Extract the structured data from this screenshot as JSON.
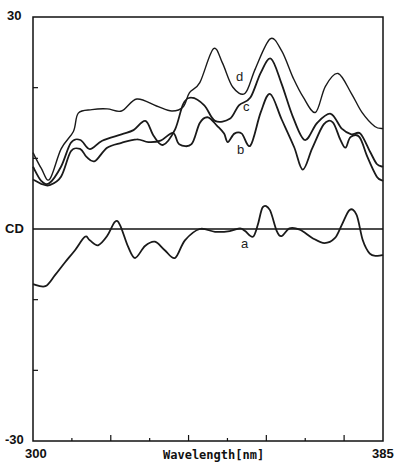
{
  "chart_data": {
    "type": "line",
    "title": "",
    "xlabel": "Wavelength[nm]",
    "ylabel": "CD",
    "xlim": [
      300,
      385
    ],
    "ylim": [
      -30,
      30
    ],
    "x_tick_labels": [
      "300",
      "385"
    ],
    "y_tick_labels": [
      "30",
      "-30"
    ],
    "y_ticks": [
      30,
      20,
      10,
      0,
      -10,
      -20,
      -30
    ],
    "x_ticks_minor_count": 8,
    "grid": false,
    "legend": "curve labels placed inline (a, b, c, d)",
    "zero_line": true,
    "series": [
      {
        "name": "a",
        "label_pos": [
          351,
          -2.3
        ],
        "points": [
          [
            300,
            -7.8
          ],
          [
            303,
            -8.1
          ],
          [
            305.4,
            -6.5
          ],
          [
            307.8,
            -4.7
          ],
          [
            310.2,
            -3.0
          ],
          [
            312.6,
            -1.1
          ],
          [
            313.8,
            -1.6
          ],
          [
            315.8,
            -2.3
          ],
          [
            318,
            -1.0
          ],
          [
            319.9,
            1.0
          ],
          [
            321.1,
            0.6
          ],
          [
            323.1,
            -2.5
          ],
          [
            324.8,
            -4.1
          ],
          [
            327.2,
            -2.4
          ],
          [
            329.6,
            -1.8
          ],
          [
            332,
            -3.0
          ],
          [
            334.5,
            -4.1
          ],
          [
            336.9,
            -1.6
          ],
          [
            340.5,
            0
          ],
          [
            344.2,
            -0.4
          ],
          [
            347.8,
            -0.3
          ],
          [
            350.3,
            0.1
          ],
          [
            351.5,
            -0.3
          ],
          [
            353.4,
            -1.1
          ],
          [
            354.6,
            0.6
          ],
          [
            355.8,
            3.1
          ],
          [
            357.5,
            2.7
          ],
          [
            359.2,
            -0.3
          ],
          [
            360.4,
            -1.0
          ],
          [
            362.3,
            0.1
          ],
          [
            364.8,
            -0.1
          ],
          [
            367.9,
            -1.3
          ],
          [
            370.8,
            -2.0
          ],
          [
            373.3,
            -1.3
          ],
          [
            375,
            0.6
          ],
          [
            376.9,
            2.7
          ],
          [
            378.6,
            2.0
          ],
          [
            380.1,
            -1.6
          ],
          [
            381.8,
            -3.5
          ],
          [
            383.5,
            -3.8
          ],
          [
            385,
            -3.7
          ]
        ]
      },
      {
        "name": "b",
        "label_pos": [
          350.5,
          11.2
        ],
        "points": [
          [
            300,
            7.0
          ],
          [
            302,
            6.4
          ],
          [
            304,
            6.2
          ],
          [
            306.8,
            7.4
          ],
          [
            309.2,
            11.0
          ],
          [
            311.5,
            11.3
          ],
          [
            313,
            10.2
          ],
          [
            315,
            9.6
          ],
          [
            318,
            11.5
          ],
          [
            321.5,
            12.2
          ],
          [
            325.2,
            12.7
          ],
          [
            328,
            12.3
          ],
          [
            331,
            12.5
          ],
          [
            334,
            13.6
          ],
          [
            335.5,
            12.0
          ],
          [
            338.5,
            12.0
          ],
          [
            340.5,
            15.0
          ],
          [
            342.5,
            15.8
          ],
          [
            344.7,
            14.6
          ],
          [
            346.4,
            13.5
          ],
          [
            347.3,
            12.3
          ],
          [
            348.9,
            13.5
          ],
          [
            350.7,
            13.5
          ],
          [
            352.8,
            11.8
          ],
          [
            355.3,
            16.5
          ],
          [
            357.6,
            19.1
          ],
          [
            360.4,
            15.5
          ],
          [
            363.4,
            11.6
          ],
          [
            365.5,
            8.4
          ],
          [
            367.8,
            11.4
          ],
          [
            370.6,
            14.8
          ],
          [
            372.8,
            15.1
          ],
          [
            374.6,
            12.7
          ],
          [
            375.9,
            11.5
          ],
          [
            377.1,
            13.0
          ],
          [
            379.3,
            13.0
          ],
          [
            381.2,
            10.2
          ],
          [
            383.5,
            7.4
          ],
          [
            385,
            6.8
          ]
        ]
      },
      {
        "name": "c",
        "label_pos": [
          351.5,
          17.2
        ],
        "points": [
          [
            300,
            8.8
          ],
          [
            302,
            6.8
          ],
          [
            304,
            6.5
          ],
          [
            306.8,
            8.8
          ],
          [
            309.2,
            12.2
          ],
          [
            311.5,
            12.6
          ],
          [
            313.8,
            11.3
          ],
          [
            316.8,
            12.5
          ],
          [
            321.5,
            13.4
          ],
          [
            324.4,
            14.0
          ],
          [
            327.3,
            15.3
          ],
          [
            329.3,
            13.2
          ],
          [
            331.6,
            11.9
          ],
          [
            334.5,
            14.1
          ],
          [
            336.5,
            17.7
          ],
          [
            338.5,
            18.6
          ],
          [
            341.6,
            17.5
          ],
          [
            344.2,
            15.3
          ],
          [
            347.8,
            15.6
          ],
          [
            350,
            17.5
          ],
          [
            352.8,
            18.6
          ],
          [
            355.3,
            22.1
          ],
          [
            357.8,
            24.1
          ],
          [
            360.4,
            20.5
          ],
          [
            363.1,
            15.9
          ],
          [
            366,
            12.6
          ],
          [
            369,
            15.0
          ],
          [
            372.3,
            16.3
          ],
          [
            375,
            14.2
          ],
          [
            377.3,
            13.4
          ],
          [
            379.5,
            13.5
          ],
          [
            381.8,
            11.0
          ],
          [
            383.5,
            9.2
          ],
          [
            385,
            8.8
          ]
        ]
      },
      {
        "name": "d",
        "label_pos": [
          349.5,
          21.5
        ],
        "points": [
          [
            300,
            10.8
          ],
          [
            302,
            8.6
          ],
          [
            304,
            7.0
          ],
          [
            306.8,
            11.3
          ],
          [
            309.8,
            13.8
          ],
          [
            311,
            16.4
          ],
          [
            314.3,
            16.9
          ],
          [
            318,
            17.0
          ],
          [
            321.5,
            16.7
          ],
          [
            325.2,
            18.4
          ],
          [
            330,
            17.4
          ],
          [
            333.7,
            16.7
          ],
          [
            336.5,
            17.3
          ],
          [
            338,
            19.3
          ],
          [
            340.5,
            20.7
          ],
          [
            343.8,
            25.5
          ],
          [
            346,
            23.5
          ],
          [
            348.5,
            20.1
          ],
          [
            351.5,
            19.2
          ],
          [
            354,
            22.7
          ],
          [
            357.6,
            26.9
          ],
          [
            360.4,
            25.2
          ],
          [
            363.1,
            21.5
          ],
          [
            365.6,
            18.7
          ],
          [
            368.6,
            16.5
          ],
          [
            371,
            20.2
          ],
          [
            374.1,
            22.0
          ],
          [
            377.3,
            19.2
          ],
          [
            379.9,
            16.5
          ],
          [
            383,
            14.5
          ],
          [
            385,
            14.2
          ]
        ]
      }
    ]
  },
  "labels": {
    "y_top": "30",
    "y_bottom": "-30",
    "y_axis": "CD",
    "x_left": "300",
    "x_right": "385",
    "x_axis": "Wavelength[nm]",
    "curve_a": "a",
    "curve_b": "b",
    "curve_c": "c",
    "curve_d": "d"
  },
  "colors": {
    "line": "#1a1a1a",
    "axis": "#111111",
    "background": "#ffffff"
  }
}
